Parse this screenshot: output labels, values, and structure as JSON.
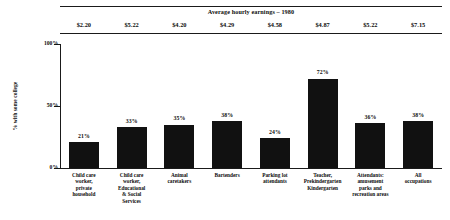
{
  "header": {
    "title": "Average hourly earnings – 1980"
  },
  "axis": {
    "ylabel": "% with some college",
    "yticks": [
      "100%",
      "50%",
      "0%"
    ],
    "ytick_values": [
      100,
      50,
      0
    ]
  },
  "chart_data": {
    "type": "bar",
    "title": "Average hourly earnings – 1980",
    "xlabel": "",
    "ylabel": "% with some college",
    "ylim": [
      0,
      100
    ],
    "grid": false,
    "legend": "none",
    "bar_color": "#111111",
    "categories": [
      "Child care worker, private household",
      "Child care worker, Educational & Social Services",
      "Animal caretakers",
      "Bartenders",
      "Parking lot attendants",
      "Teacher, Prekindergarten Kindergarten",
      "Attendants: amusement parks and recreation areas",
      "All occupations"
    ],
    "category_lines": [
      [
        "Child care",
        "worker,",
        "private",
        "household"
      ],
      [
        "Child care",
        "worker,",
        "Educational",
        "& Social",
        "Services"
      ],
      [
        "Animal",
        "caretakers"
      ],
      [
        "Bartenders"
      ],
      [
        "Parking lot",
        "attendants"
      ],
      [
        "Teacher,",
        "Prekindergarten",
        "Kindergarten"
      ],
      [
        "Attendants:",
        "amusement",
        "parks and",
        "recreation areas"
      ],
      [
        "All",
        "occupations"
      ]
    ],
    "values": [
      21,
      33,
      35,
      38,
      24,
      72,
      36,
      38
    ],
    "value_labels": [
      "21%",
      "33%",
      "35%",
      "38%",
      "24%",
      "72%",
      "36%",
      "38%"
    ],
    "earnings": [
      "$2.20",
      "$5.22",
      "$4.20",
      "$4.29",
      "$4.58",
      "$4.87",
      "$5.22",
      "$7.15"
    ],
    "earnings_values": [
      2.2,
      5.22,
      4.2,
      4.29,
      4.58,
      4.87,
      5.22,
      7.15
    ]
  }
}
